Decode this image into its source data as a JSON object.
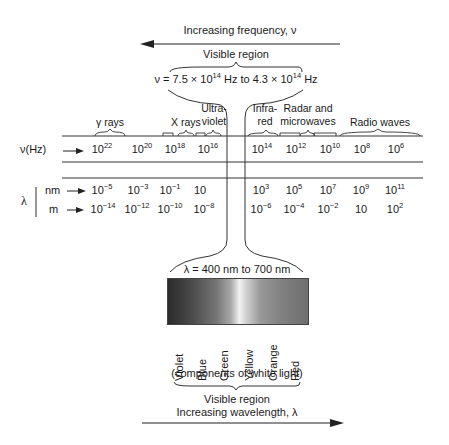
{
  "top": {
    "frequency_arrow_label": "Increasing frequency, ν",
    "visible_region_label": "Visible region",
    "visible_frequency_range": "ν = 7.5 × 10^14 Hz to 4.3 × 10^14 Hz",
    "nu_prefix": "ν = 7.5 × 10",
    "nu_exp1": "14",
    "nu_mid": " Hz  to 4.3 × 10",
    "nu_exp2": "14",
    "nu_suffix": " Hz"
  },
  "regions": [
    {
      "label": "γ rays"
    },
    {
      "label": "X rays"
    },
    {
      "label_line1": "Ultra-",
      "label_line2": "violet"
    },
    {
      "label_line1": "Infra-",
      "label_line2": "red"
    },
    {
      "label_line1": "Radar and",
      "label_line2": "microwaves"
    },
    {
      "label": "Radio waves"
    }
  ],
  "frequency_row": {
    "label": "ν(Hz)",
    "values": [
      {
        "base": "10",
        "exp": "22"
      },
      {
        "base": "10",
        "exp": "20"
      },
      {
        "base": "10",
        "exp": "18"
      },
      {
        "base": "10",
        "exp": "16"
      },
      {
        "base": "10",
        "exp": "14"
      },
      {
        "base": "10",
        "exp": "12"
      },
      {
        "base": "10",
        "exp": "10"
      },
      {
        "base": "10",
        "exp": "8"
      },
      {
        "base": "10",
        "exp": "6"
      }
    ]
  },
  "wavelength": {
    "symbol": "λ",
    "nm_row": {
      "label": "nm",
      "values": [
        {
          "base": "10",
          "exp": "−5"
        },
        {
          "base": "10",
          "exp": "−3"
        },
        {
          "base": "10",
          "exp": "−1"
        },
        {
          "base": "10",
          "exp": ""
        },
        {
          "base": "10",
          "exp": "3"
        },
        {
          "base": "10",
          "exp": "5"
        },
        {
          "base": "10",
          "exp": "7"
        },
        {
          "base": "10",
          "exp": "9"
        },
        {
          "base": "10",
          "exp": "11"
        }
      ]
    },
    "m_row": {
      "label": "m",
      "values": [
        {
          "base": "10",
          "exp": "−14"
        },
        {
          "base": "10",
          "exp": "−12"
        },
        {
          "base": "10",
          "exp": "−10"
        },
        {
          "base": "10",
          "exp": "−8"
        },
        {
          "base": "10",
          "exp": "−6"
        },
        {
          "base": "10",
          "exp": "−4"
        },
        {
          "base": "10",
          "exp": "−2"
        },
        {
          "base": "10",
          "exp": ""
        },
        {
          "base": "10",
          "exp": "2"
        }
      ]
    }
  },
  "visible": {
    "wavelength_range": "λ = 400 nm to 700 nm",
    "colors": [
      "Violet",
      "Blue",
      "Green",
      "Yellow",
      "Orange",
      "Red"
    ],
    "components_label": "(components of white light)",
    "visible_region_label": "Visible region",
    "wavelength_arrow_label": "Increasing wavelength, λ"
  }
}
